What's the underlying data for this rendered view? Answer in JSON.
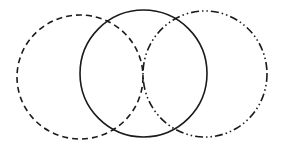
{
  "diagram": {
    "type": "venn",
    "background": "#ffffff",
    "stroke_color": "#1a1a1a",
    "circles": [
      {
        "id": "left",
        "style": "dashed",
        "cx": 80,
        "cy": 77,
        "rx": 63,
        "ry": 62,
        "dasharray": "6 4"
      },
      {
        "id": "center",
        "style": "solid",
        "cx": 143.5,
        "cy": 73.5,
        "rx": 63.5,
        "ry": 63.5,
        "dasharray": "none"
      },
      {
        "id": "right",
        "style": "dash-dot-dot",
        "cx": 205,
        "cy": 74,
        "rx": 62,
        "ry": 63,
        "dasharray": "8 3 1.5 3 1.5 3"
      }
    ]
  }
}
